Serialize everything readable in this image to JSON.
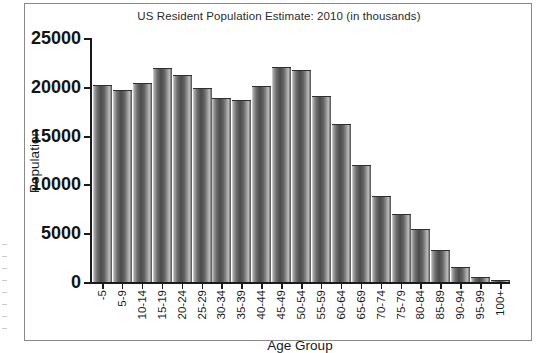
{
  "chart_data": {
    "type": "bar",
    "title": "US Resident Population Estimate: 2010 (in thousands)",
    "xlabel": "Age Group",
    "ylabel": "Population",
    "ylim": [
      0,
      25000
    ],
    "yticks": [
      0,
      5000,
      10000,
      15000,
      20000,
      25000
    ],
    "ytick_labels": [
      "0",
      "5000",
      "10000",
      "15000",
      "20000",
      "25000"
    ],
    "grid": false,
    "legend": null,
    "categories": [
      "-5",
      "5-9",
      "10-14",
      "15-19",
      "20-24",
      "25-29",
      "30-34",
      "35-39",
      "40-44",
      "45-49",
      "50-54",
      "55-59",
      "60-64",
      "65-69",
      "70-74",
      "75-79",
      "80-84",
      "85-89",
      "90-94",
      "95-99",
      "100+"
    ],
    "values": [
      20200,
      19700,
      20400,
      21900,
      21200,
      19900,
      18900,
      18600,
      20100,
      22000,
      21700,
      19100,
      16200,
      12000,
      8800,
      7000,
      5400,
      3300,
      1500,
      500,
      100
    ]
  },
  "axes": {
    "y_title": "Population",
    "x_title": "Age Group"
  }
}
